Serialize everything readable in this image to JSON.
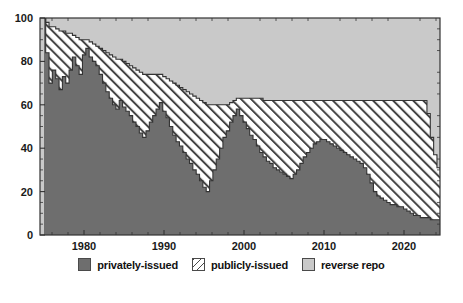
{
  "chart_data": {
    "type": "area",
    "stacked": true,
    "normalized_percent": true,
    "title": "",
    "xlabel": "",
    "ylabel": "",
    "xlim": [
      1974.5,
      2024.5
    ],
    "ylim": [
      0,
      100
    ],
    "grid": false,
    "legend_position": "bottom",
    "x_ticks": [
      1980,
      1990,
      2000,
      2010,
      2020
    ],
    "x_tick_labels": [
      "1980",
      "1990",
      "2000",
      "2010",
      "2020"
    ],
    "y_ticks": [
      0,
      20,
      40,
      60,
      80,
      100
    ],
    "y_tick_labels": [
      "0",
      "20",
      "40",
      "60",
      "80",
      "100"
    ],
    "minor_x_tick_interval": 2,
    "minor_y_tick_interval": 5,
    "series": [
      {
        "name": "privately-issued",
        "color": "#6e6e6e",
        "fill": "solid",
        "stack_order": 0,
        "values": [
          100,
          84,
          70,
          76,
          72,
          67,
          73,
          70,
          76,
          82,
          78,
          74,
          83,
          86,
          82,
          80,
          78,
          74,
          70,
          66,
          63,
          60,
          58,
          62,
          59,
          57,
          55,
          52,
          50,
          47,
          45,
          48,
          52,
          55,
          58,
          61,
          57,
          54,
          50,
          46,
          43,
          41,
          38,
          35,
          33,
          30,
          28,
          25,
          22,
          20,
          25,
          30,
          35,
          40,
          45,
          48,
          52,
          55,
          58,
          55,
          52,
          49,
          46,
          44,
          41,
          38,
          36,
          34,
          33,
          31,
          30,
          29,
          28,
          27,
          26,
          28,
          30,
          33,
          36,
          38,
          40,
          42,
          43,
          44,
          44,
          43,
          42,
          41,
          40,
          39,
          38,
          37,
          36,
          35,
          34,
          33,
          31,
          28,
          24,
          20,
          18,
          17,
          16,
          15,
          14,
          14,
          13,
          13,
          12,
          11,
          10,
          9,
          9,
          8,
          8,
          8,
          7,
          7,
          7,
          8
        ]
      },
      {
        "name": "publicly-issued",
        "color": "#ffffff",
        "fill": "diagonal-hatch",
        "stack_order": 1,
        "values": [
          0,
          14,
          26,
          20,
          23,
          27,
          21,
          23,
          17,
          10,
          13,
          16,
          7,
          4,
          7,
          8,
          9,
          12,
          15,
          18,
          20,
          22,
          23,
          19,
          21,
          22,
          23,
          25,
          26,
          28,
          29,
          26,
          22,
          19,
          16,
          13,
          16,
          18,
          21,
          24,
          26,
          27,
          29,
          31,
          32,
          34,
          35,
          37,
          39,
          40,
          35,
          30,
          25,
          20,
          15,
          12,
          9,
          7,
          5,
          8,
          11,
          14,
          17,
          19,
          22,
          25,
          26,
          28,
          29,
          31,
          32,
          33,
          34,
          35,
          36,
          34,
          32,
          29,
          26,
          24,
          22,
          20,
          19,
          18,
          18,
          19,
          20,
          21,
          22,
          23,
          24,
          25,
          26,
          27,
          28,
          29,
          31,
          34,
          38,
          42,
          44,
          45,
          46,
          47,
          48,
          48,
          49,
          49,
          50,
          51,
          52,
          53,
          53,
          54,
          54,
          48,
          38,
          30,
          24,
          20
        ]
      },
      {
        "name": "reverse repo",
        "color": "#c9c9c9",
        "fill": "solid",
        "stack_order": 2,
        "values": [
          0,
          2,
          4,
          4,
          5,
          6,
          6,
          7,
          7,
          8,
          9,
          10,
          10,
          10,
          11,
          12,
          13,
          14,
          15,
          16,
          17,
          18,
          19,
          19,
          20,
          21,
          22,
          23,
          24,
          25,
          26,
          26,
          26,
          26,
          26,
          26,
          27,
          28,
          29,
          30,
          31,
          32,
          33,
          34,
          35,
          36,
          37,
          38,
          39,
          40,
          40,
          40,
          40,
          40,
          40,
          40,
          39,
          38,
          37,
          37,
          37,
          37,
          37,
          37,
          37,
          37,
          38,
          38,
          38,
          38,
          38,
          38,
          38,
          38,
          38,
          38,
          38,
          38,
          38,
          38,
          38,
          38,
          38,
          38,
          38,
          38,
          38,
          38,
          38,
          38,
          38,
          38,
          38,
          38,
          38,
          38,
          38,
          38,
          38,
          38,
          38,
          38,
          38,
          38,
          38,
          38,
          38,
          38,
          38,
          38,
          38,
          38,
          38,
          38,
          38,
          44,
          55,
          63,
          69,
          72
        ]
      }
    ],
    "x_start": 1975,
    "x_end": 2024.75,
    "n_points": 120
  },
  "legend": {
    "items": [
      {
        "label": "privately-issued",
        "swatch": "solid-dark-gray"
      },
      {
        "label": "publicly-issued",
        "swatch": "diagonal-hatch"
      },
      {
        "label": "reverse repo",
        "swatch": "solid-light-gray"
      }
    ]
  },
  "colors": {
    "private": "#6e6e6e",
    "public": "#ffffff",
    "repo": "#c9c9c9",
    "outline": "#333333",
    "axis": "#333333",
    "text": "#111111",
    "background": "#ffffff"
  }
}
